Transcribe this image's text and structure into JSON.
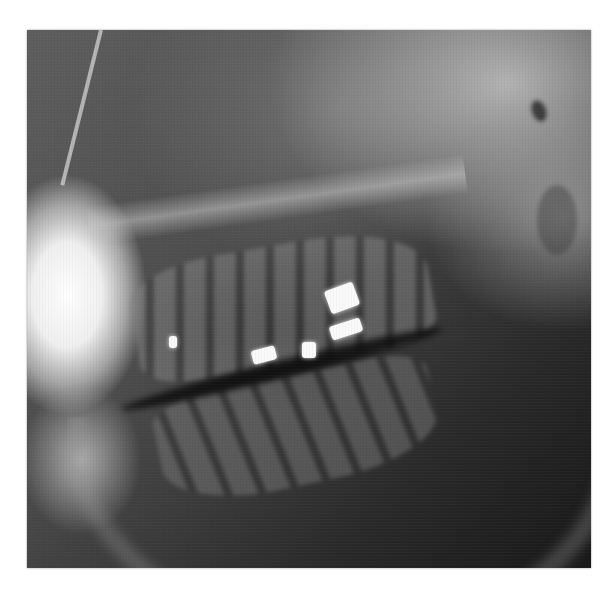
{
  "image": {
    "type": "dental-radiograph",
    "description": "Lateral oblique jaw X-ray showing upper and lower molars/premolars with bright metallic restorations",
    "tone": "grayscale",
    "colors": {
      "background": "#ffffff",
      "radiolucent": "#1a1a1a",
      "bone": "#9a9a9a",
      "restoration": "#fafafa"
    }
  },
  "features": {
    "restorations": [
      {
        "label": "filling-upper-premolar",
        "x": 143,
        "y": 307
      },
      {
        "label": "filling-upper-molar-1",
        "x": 255,
        "y": 330
      },
      {
        "label": "filling-upper-molar-2",
        "x": 302,
        "y": 315
      },
      {
        "label": "filling-upper-molar-3",
        "x": 335,
        "y": 285
      },
      {
        "label": "filling-lower-molar",
        "x": 330,
        "y": 325
      }
    ]
  }
}
